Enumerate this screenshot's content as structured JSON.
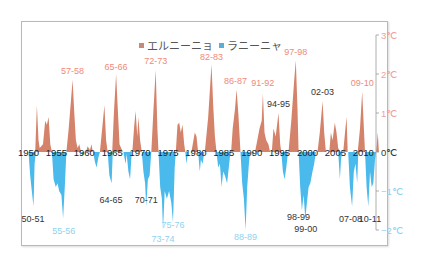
{
  "chart_data": {
    "type": "area",
    "title": "",
    "xlabel": "",
    "ylabel": "",
    "x_range": [
      1950,
      2013
    ],
    "ylim": [
      -2.3,
      3.1
    ],
    "grid": false,
    "legend": {
      "position": "top-center",
      "entries": [
        {
          "label": "エルニーニョ",
          "color": "#d4826a"
        },
        {
          "label": "ラニーニャ",
          "color": "#4ab9ec"
        }
      ]
    },
    "x_ticks": [
      "1950",
      "1955",
      "1960",
      "1965",
      "1970",
      "1975",
      "1980",
      "1985",
      "1990",
      "1995",
      "2000",
      "2005",
      "2010"
    ],
    "y_ticks": [
      {
        "value": 3,
        "label": "3℃",
        "color": "#f0a0a0"
      },
      {
        "value": 2,
        "label": "2℃",
        "color": "#f0a0a0"
      },
      {
        "value": 1,
        "label": "1℃",
        "color": "#f0a0a0"
      },
      {
        "value": 0,
        "label": "0℃",
        "color": "#333333"
      },
      {
        "value": -1,
        "label": "−1℃",
        "color": "#8fd2f0"
      },
      {
        "value": -2,
        "label": "−2℃",
        "color": "#8fd2f0"
      }
    ],
    "series": [
      {
        "name": "エルニーニョ",
        "color": "#d4826a",
        "points": [
          [
            1950.0,
            0
          ],
          [
            1951.2,
            0
          ],
          [
            1951.5,
            1.2
          ],
          [
            1951.8,
            0.3
          ],
          [
            1952.0,
            0.1
          ],
          [
            1952.6,
            0.2
          ],
          [
            1953.0,
            0.8
          ],
          [
            1953.3,
            0.7
          ],
          [
            1953.6,
            0.9
          ],
          [
            1953.9,
            0.2
          ],
          [
            1954.2,
            0
          ],
          [
            1956.8,
            0
          ],
          [
            1957.2,
            0.6
          ],
          [
            1957.6,
            1.3
          ],
          [
            1957.9,
            1.85
          ],
          [
            1958.2,
            1.0
          ],
          [
            1958.5,
            0.3
          ],
          [
            1958.8,
            0.1
          ],
          [
            1959.1,
            0.2
          ],
          [
            1959.4,
            0
          ],
          [
            1960.3,
            0
          ],
          [
            1960.6,
            0.15
          ],
          [
            1961.0,
            0.05
          ],
          [
            1961.3,
            0.2
          ],
          [
            1961.5,
            0
          ],
          [
            1962.8,
            0
          ],
          [
            1963.2,
            0.6
          ],
          [
            1963.6,
            1.2
          ],
          [
            1963.9,
            0.3
          ],
          [
            1964.2,
            0
          ],
          [
            1965.0,
            0
          ],
          [
            1965.3,
            1.0
          ],
          [
            1965.7,
            2.0
          ],
          [
            1966.0,
            1.1
          ],
          [
            1966.3,
            0.2
          ],
          [
            1966.6,
            0.1
          ],
          [
            1966.9,
            0
          ],
          [
            1968.6,
            0
          ],
          [
            1968.9,
            0.6
          ],
          [
            1969.2,
            1.05
          ],
          [
            1969.5,
            0.4
          ],
          [
            1969.7,
            0.9
          ],
          [
            1970.0,
            0.3
          ],
          [
            1970.3,
            0
          ],
          [
            1972.0,
            0
          ],
          [
            1972.4,
            1.1
          ],
          [
            1972.8,
            2.1
          ],
          [
            1973.1,
            0.6
          ],
          [
            1973.3,
            0
          ],
          [
            1976.4,
            0
          ],
          [
            1976.7,
            0.7
          ],
          [
            1977.0,
            0.75
          ],
          [
            1977.3,
            0.5
          ],
          [
            1977.6,
            0.7
          ],
          [
            1977.9,
            0.2
          ],
          [
            1978.1,
            0
          ],
          [
            1979.2,
            0
          ],
          [
            1979.5,
            0.25
          ],
          [
            1979.8,
            0.5
          ],
          [
            1980.1,
            0.4
          ],
          [
            1980.4,
            0
          ],
          [
            1981.6,
            0
          ],
          [
            1982.2,
            0.9
          ],
          [
            1982.8,
            2.25
          ],
          [
            1983.1,
            1.2
          ],
          [
            1983.4,
            0.4
          ],
          [
            1983.7,
            0
          ],
          [
            1986.3,
            0
          ],
          [
            1986.6,
            0.6
          ],
          [
            1987.0,
            1.1
          ],
          [
            1987.3,
            1.6
          ],
          [
            1987.6,
            1.0
          ],
          [
            1988.0,
            0
          ],
          [
            1990.6,
            0
          ],
          [
            1991.0,
            0.3
          ],
          [
            1991.4,
            0.6
          ],
          [
            1991.8,
            0.8
          ],
          [
            1992.0,
            1.5
          ],
          [
            1992.3,
            0.5
          ],
          [
            1992.6,
            0.3
          ],
          [
            1993.0,
            0.2
          ],
          [
            1993.3,
            0
          ],
          [
            1993.6,
            0
          ],
          [
            1993.9,
            0.6
          ],
          [
            1994.3,
            0.4
          ],
          [
            1994.8,
            1.0
          ],
          [
            1995.1,
            0.2
          ],
          [
            1995.3,
            0
          ],
          [
            1996.6,
            0
          ],
          [
            1997.1,
            0.8
          ],
          [
            1997.6,
            1.8
          ],
          [
            1997.9,
            2.35
          ],
          [
            1998.2,
            1.1
          ],
          [
            1998.4,
            0
          ],
          [
            2001.8,
            0
          ],
          [
            2002.2,
            0.5
          ],
          [
            2002.7,
            1.3
          ],
          [
            2003.0,
            0.5
          ],
          [
            2003.3,
            0
          ],
          [
            2003.9,
            0
          ],
          [
            2004.2,
            0.5
          ],
          [
            2004.5,
            0.3
          ],
          [
            2004.9,
            0.75
          ],
          [
            2005.2,
            0.5
          ],
          [
            2005.5,
            0.1
          ],
          [
            2005.8,
            0
          ],
          [
            2006.4,
            0
          ],
          [
            2006.8,
            0.6
          ],
          [
            2007.0,
            0.9
          ],
          [
            2007.2,
            0
          ],
          [
            2009.0,
            0
          ],
          [
            2009.4,
            0.6
          ],
          [
            2009.8,
            1.55
          ],
          [
            2010.1,
            0.6
          ],
          [
            2010.3,
            0
          ],
          [
            2012.3,
            0
          ],
          [
            2012.6,
            0.5
          ],
          [
            2012.8,
            0
          ]
        ]
      },
      {
        "name": "ラニーニャ",
        "color": "#4ab9ec",
        "points": [
          [
            1950.0,
            0
          ],
          [
            1950.3,
            -0.6
          ],
          [
            1950.6,
            -1.0
          ],
          [
            1950.9,
            -1.4
          ],
          [
            1951.1,
            -0.3
          ],
          [
            1951.3,
            0
          ],
          [
            1954.2,
            0
          ],
          [
            1954.5,
            -0.7
          ],
          [
            1954.9,
            -0.9
          ],
          [
            1955.2,
            -0.8
          ],
          [
            1955.5,
            -1.0
          ],
          [
            1955.9,
            -1.1
          ],
          [
            1956.2,
            -1.7
          ],
          [
            1956.5,
            -0.9
          ],
          [
            1956.8,
            0
          ],
          [
            1959.4,
            0
          ],
          [
            1959.7,
            -0.1
          ],
          [
            1960.0,
            0
          ],
          [
            1961.6,
            0
          ],
          [
            1961.9,
            -0.25
          ],
          [
            1962.2,
            -0.4
          ],
          [
            1962.5,
            -0.15
          ],
          [
            1962.8,
            0
          ],
          [
            1964.2,
            0
          ],
          [
            1964.5,
            -0.6
          ],
          [
            1964.9,
            -0.8
          ],
          [
            1965.1,
            0
          ],
          [
            1967.0,
            0
          ],
          [
            1967.4,
            -0.3
          ],
          [
            1967.6,
            -0.05
          ],
          [
            1967.9,
            -0.5
          ],
          [
            1968.2,
            -0.7
          ],
          [
            1968.5,
            0
          ],
          [
            1970.3,
            0
          ],
          [
            1970.6,
            -0.5
          ],
          [
            1970.9,
            -0.8
          ],
          [
            1971.1,
            -1.4
          ],
          [
            1971.4,
            -0.7
          ],
          [
            1971.7,
            -0.6
          ],
          [
            1972.0,
            0
          ],
          [
            1973.3,
            0
          ],
          [
            1973.6,
            -0.9
          ],
          [
            1973.9,
            -1.2
          ],
          [
            1974.1,
            -2.0
          ],
          [
            1974.4,
            -1.0
          ],
          [
            1974.8,
            -1.2
          ],
          [
            1975.2,
            -1.0
          ],
          [
            1975.6,
            -1.3
          ],
          [
            1975.9,
            -1.8
          ],
          [
            1976.2,
            -0.4
          ],
          [
            1976.4,
            0
          ],
          [
            1978.1,
            0
          ],
          [
            1978.3,
            -0.3
          ],
          [
            1978.6,
            0
          ],
          [
            1980.4,
            0
          ],
          [
            1980.7,
            -0.5
          ],
          [
            1980.9,
            -0.2
          ],
          [
            1981.2,
            -0.3
          ],
          [
            1981.5,
            0
          ],
          [
            1983.7,
            0
          ],
          [
            1984.0,
            -0.4
          ],
          [
            1984.3,
            -0.3
          ],
          [
            1984.6,
            -0.9
          ],
          [
            1984.9,
            -0.5
          ],
          [
            1985.2,
            -0.6
          ],
          [
            1985.6,
            -0.8
          ],
          [
            1985.9,
            -0.4
          ],
          [
            1986.2,
            0
          ],
          [
            1988.0,
            0
          ],
          [
            1988.3,
            -0.8
          ],
          [
            1988.6,
            -1.2
          ],
          [
            1988.9,
            -2.0
          ],
          [
            1989.2,
            -0.9
          ],
          [
            1989.5,
            -0.3
          ],
          [
            1989.7,
            0
          ],
          [
            1990.0,
            0
          ],
          [
            1990.2,
            -0.1
          ],
          [
            1990.4,
            0
          ],
          [
            1995.3,
            0
          ],
          [
            1995.6,
            -0.5
          ],
          [
            1995.9,
            -0.7
          ],
          [
            1996.2,
            -0.4
          ],
          [
            1996.5,
            0
          ],
          [
            1998.4,
            0
          ],
          [
            1998.7,
            -0.9
          ],
          [
            1999.0,
            -1.5
          ],
          [
            1999.3,
            -1.1
          ],
          [
            1999.6,
            -1.7
          ],
          [
            1999.9,
            -1.3
          ],
          [
            2000.2,
            -0.9
          ],
          [
            2000.5,
            -0.8
          ],
          [
            2000.9,
            -0.5
          ],
          [
            2001.2,
            -0.3
          ],
          [
            2001.5,
            0
          ],
          [
            2005.5,
            0
          ],
          [
            2005.8,
            -0.7
          ],
          [
            2006.0,
            -0.2
          ],
          [
            2006.2,
            0
          ],
          [
            2007.3,
            0
          ],
          [
            2007.6,
            -0.9
          ],
          [
            2008.0,
            -1.4
          ],
          [
            2008.3,
            -0.5
          ],
          [
            2008.6,
            -0.3
          ],
          [
            2008.9,
            -0.8
          ],
          [
            2009.1,
            0
          ],
          [
            2010.3,
            0
          ],
          [
            2010.6,
            -0.9
          ],
          [
            2010.9,
            -1.4
          ],
          [
            2011.2,
            -0.5
          ],
          [
            2011.5,
            -0.9
          ],
          [
            2011.8,
            -0.8
          ],
          [
            2012.1,
            -0.2
          ],
          [
            2012.3,
            0
          ]
        ]
      }
    ],
    "annotations": [
      {
        "text": "57-58",
        "x": 1957.9,
        "y": 2.0,
        "color": "#f08a7a",
        "anchor": "above"
      },
      {
        "text": "65-66",
        "x": 1965.7,
        "y": 2.1,
        "color": "#f08a7a",
        "anchor": "above"
      },
      {
        "text": "72-73",
        "x": 1972.8,
        "y": 2.25,
        "color": "#f08a7a",
        "anchor": "above"
      },
      {
        "text": "82-83",
        "x": 1982.8,
        "y": 2.35,
        "color": "#f08a7a",
        "anchor": "above"
      },
      {
        "text": "86-87",
        "x": 1987.1,
        "y": 1.75,
        "color": "#f08a7a",
        "anchor": "above"
      },
      {
        "text": "91-92",
        "x": 1992.0,
        "y": 1.7,
        "color": "#f08a7a",
        "anchor": "above"
      },
      {
        "text": "94-95",
        "x": 1994.8,
        "y": 1.15,
        "color": "#333333",
        "anchor": "above"
      },
      {
        "text": "97-98",
        "x": 1997.9,
        "y": 2.5,
        "color": "#f08a7a",
        "anchor": "above"
      },
      {
        "text": "02-03",
        "x": 2002.7,
        "y": 1.45,
        "color": "#333333",
        "anchor": "above"
      },
      {
        "text": "09-10",
        "x": 2009.8,
        "y": 1.7,
        "color": "#f08a7a",
        "anchor": "above"
      },
      {
        "text": "50-51",
        "x": 1950.8,
        "y": -1.6,
        "color": "#333333",
        "anchor": "below"
      },
      {
        "text": "55-56",
        "x": 1956.3,
        "y": -1.9,
        "color": "#8fd2f0",
        "anchor": "below"
      },
      {
        "text": "64-65",
        "x": 1964.8,
        "y": -1.1,
        "color": "#333333",
        "anchor": "below"
      },
      {
        "text": "70-71",
        "x": 1971.1,
        "y": -1.1,
        "color": "#333333",
        "anchor": "below"
      },
      {
        "text": "73-74",
        "x": 1974.1,
        "y": -2.1,
        "color": "#8fd2f0",
        "anchor": "below"
      },
      {
        "text": "75-76",
        "x": 1975.9,
        "y": -1.75,
        "color": "#8fd2f0",
        "anchor": "below"
      },
      {
        "text": "88-89",
        "x": 1988.9,
        "y": -2.05,
        "color": "#8fd2f0",
        "anchor": "below"
      },
      {
        "text": "98-99",
        "x": 1998.4,
        "y": -1.55,
        "color": "#333333",
        "anchor": "below"
      },
      {
        "text": "99-00",
        "x": 1999.7,
        "y": -1.85,
        "color": "#333333",
        "anchor": "below"
      },
      {
        "text": "07-08",
        "x": 2007.7,
        "y": -1.6,
        "color": "#333333",
        "anchor": "below"
      },
      {
        "text": "10-11",
        "x": 2011.2,
        "y": -1.6,
        "color": "#333333",
        "anchor": "below"
      }
    ]
  }
}
